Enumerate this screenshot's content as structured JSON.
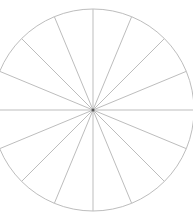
{
  "diagram": {
    "type": "polar-wheel",
    "center": [
      93,
      110
    ],
    "radius": 101,
    "spokes": 16,
    "angle_step_deg": 22.5,
    "stroke_color": "#bdbdbd",
    "center_dot_color": "#555555",
    "background": "#ffffff"
  }
}
